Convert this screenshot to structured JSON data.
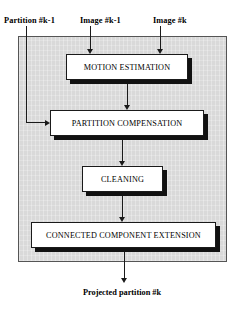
{
  "diagram": {
    "inputs": [
      {
        "id": "partition-km1",
        "label": "Partition #k-1"
      },
      {
        "id": "image-km1",
        "label": "Image #k-1"
      },
      {
        "id": "image-k",
        "label": "Image #k"
      }
    ],
    "stages": [
      {
        "id": "motion-estimation",
        "label": "MOTION ESTIMATION"
      },
      {
        "id": "partition-compensation",
        "label": "PARTITION COMPENSATION"
      },
      {
        "id": "cleaning",
        "label": "CLEANING"
      },
      {
        "id": "connected-component-extension",
        "label": "CONNECTED COMPONENT EXTENSION"
      }
    ],
    "output": {
      "id": "projected-partition-k",
      "label": "Projected partition #k"
    },
    "colors": {
      "panel_fill": "#d9d9d9",
      "panel_border": "#555555",
      "box_fill": "#ffffff",
      "box_border": "#1a1a1a",
      "box_shadow": "#111111",
      "connector": "#1a1a1a",
      "text": "#000000",
      "background": "#ffffff"
    }
  }
}
